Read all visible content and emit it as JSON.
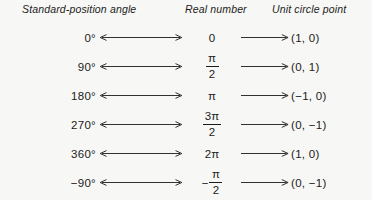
{
  "headers": {
    "angle": "Standard-position angle",
    "real": "Real number",
    "point": "Unit circle point"
  },
  "connectors": {
    "left_icon": "double-headed-arrow",
    "right_icon": "right-arrow"
  },
  "rows": [
    {
      "angle": "0°",
      "real_kind": "plain",
      "real": "0",
      "real_sign": "",
      "real_num": "",
      "real_den": "",
      "point": "(1, 0)"
    },
    {
      "angle": "90°",
      "real_kind": "fraction",
      "real": "π/2",
      "real_sign": "",
      "real_num": "π",
      "real_den": "2",
      "point": "(0, 1)"
    },
    {
      "angle": "180°",
      "real_kind": "plain",
      "real": "π",
      "real_sign": "",
      "real_num": "",
      "real_den": "",
      "point": "(−1, 0)"
    },
    {
      "angle": "270°",
      "real_kind": "fraction",
      "real": "3π/2",
      "real_sign": "",
      "real_num": "3π",
      "real_den": "2",
      "point": "(0, −1)"
    },
    {
      "angle": "360°",
      "real_kind": "plain",
      "real": "2π",
      "real_sign": "",
      "real_num": "",
      "real_den": "",
      "point": "(1, 0)"
    },
    {
      "angle": "−90°",
      "real_kind": "fraction",
      "real": "−π/2",
      "real_sign": "−",
      "real_num": "π",
      "real_den": "2",
      "point": "(0, −1)"
    }
  ],
  "colors": {
    "page_background": "#f7f7f5",
    "ink": "#1b1b1b"
  }
}
